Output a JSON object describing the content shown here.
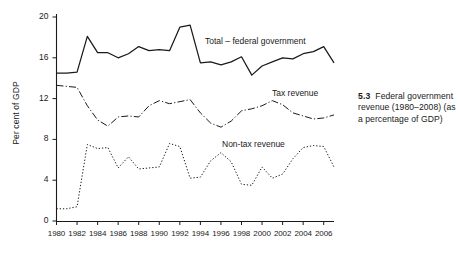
{
  "figure": {
    "caption_number": "5.3",
    "caption_text": "Federal government revenue (1980–2008) (as a percentage of GDP)"
  },
  "chart_data": {
    "type": "line",
    "title": "",
    "xlabel": "",
    "ylabel": "Per cent of GDP",
    "xlim": [
      1980,
      2007
    ],
    "ylim": [
      0,
      20
    ],
    "grid": false,
    "legend_position": "inline-annotations",
    "ytick_labels": [
      "0",
      "4",
      "8",
      "12",
      "16",
      "20"
    ],
    "ytick_values": [
      0,
      4,
      8,
      12,
      16,
      20
    ],
    "xtick_labels": [
      "1980",
      "1982",
      "1984",
      "1986",
      "1988",
      "1990",
      "1992",
      "1994",
      "1996",
      "1998",
      "2000",
      "2002",
      "2004",
      "2006"
    ],
    "xtick_values": [
      1980,
      1982,
      1984,
      1986,
      1988,
      1990,
      1992,
      1994,
      1996,
      1998,
      2000,
      2002,
      2004,
      2006
    ],
    "x": [
      1980,
      1981,
      1982,
      1983,
      1984,
      1985,
      1986,
      1987,
      1988,
      1989,
      1990,
      1991,
      1992,
      1993,
      1994,
      1995,
      1996,
      1997,
      1998,
      1999,
      2000,
      2001,
      2002,
      2003,
      2004,
      2005,
      2006,
      2007
    ],
    "series": [
      {
        "name": "Total – federal government",
        "style": "solid",
        "values": [
          14.5,
          14.5,
          14.6,
          18.1,
          16.5,
          16.5,
          16.0,
          16.4,
          17.1,
          16.7,
          16.8,
          16.7,
          19.0,
          19.2,
          15.5,
          15.6,
          15.3,
          15.6,
          16.1,
          14.3,
          15.2,
          15.6,
          16.0,
          15.9,
          16.4,
          16.6,
          17.1,
          15.5
        ]
      },
      {
        "name": "Tax revenue",
        "style": "dashdot",
        "values": [
          13.3,
          13.2,
          13.1,
          11.3,
          9.9,
          9.3,
          10.2,
          10.3,
          10.2,
          11.3,
          11.8,
          11.5,
          11.7,
          11.9,
          10.6,
          9.6,
          9.2,
          9.8,
          10.8,
          11.0,
          11.3,
          11.8,
          11.4,
          10.6,
          10.3,
          10.0,
          10.1,
          10.4
        ]
      },
      {
        "name": "Non-tax revenue",
        "style": "dotted",
        "values": [
          1.2,
          1.2,
          1.4,
          7.5,
          7.1,
          7.2,
          5.2,
          6.3,
          5.1,
          5.2,
          5.3,
          7.6,
          7.3,
          4.2,
          4.3,
          5.9,
          6.7,
          5.8,
          3.6,
          3.5,
          5.3,
          4.2,
          4.6,
          6.1,
          7.2,
          7.4,
          7.3,
          5.3
        ]
      }
    ]
  }
}
